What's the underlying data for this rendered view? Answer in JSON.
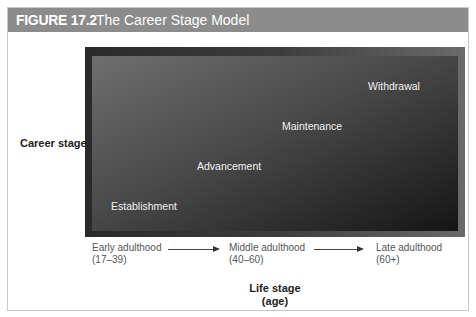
{
  "figure": {
    "number_label": "FIGURE 17.2",
    "title": "The Career Stage Model"
  },
  "axes": {
    "ylabel": "Career stage",
    "xlabel_line1": "Life stage",
    "xlabel_line2": "(age)"
  },
  "stages": [
    {
      "label": "Establishment"
    },
    {
      "label": "Advancement"
    },
    {
      "label": "Maintenance"
    },
    {
      "label": "Withdrawal"
    }
  ],
  "life_stages": [
    {
      "label": "Early adulthood",
      "range": "(17–39)"
    },
    {
      "label": "Middle adulthood",
      "range": "(40–60)"
    },
    {
      "label": "Late adulthood",
      "range": "(60+)"
    }
  ]
}
